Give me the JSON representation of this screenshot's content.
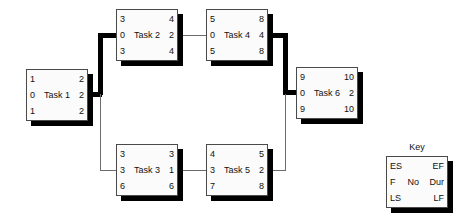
{
  "diagram": {
    "node_field_order": [
      "ES",
      "EF",
      "F",
      "No",
      "Dur",
      "LS",
      "LF"
    ]
  },
  "nodes": [
    {
      "id": "task-1",
      "name": "Task 1",
      "es": "1",
      "ef": "2",
      "f": "0",
      "dur": "2",
      "ls": "1",
      "lf": "2",
      "critical": true
    },
    {
      "id": "task-2",
      "name": "Task 2",
      "es": "3",
      "ef": "4",
      "f": "0",
      "dur": "2",
      "ls": "3",
      "lf": "4",
      "critical": true
    },
    {
      "id": "task-3",
      "name": "Task 3",
      "es": "3",
      "ef": "3",
      "f": "3",
      "dur": "1",
      "ls": "6",
      "lf": "6",
      "critical": false
    },
    {
      "id": "task-4",
      "name": "Task 4",
      "es": "5",
      "ef": "8",
      "f": "0",
      "dur": "4",
      "ls": "5",
      "lf": "8",
      "critical": true
    },
    {
      "id": "task-5",
      "name": "Task 5",
      "es": "4",
      "ef": "5",
      "f": "3",
      "dur": "2",
      "ls": "7",
      "lf": "8",
      "critical": false
    },
    {
      "id": "task-6",
      "name": "Task 6",
      "es": "9",
      "ef": "10",
      "f": "0",
      "dur": "2",
      "ls": "9",
      "lf": "10",
      "critical": true
    }
  ],
  "key": {
    "title": "Key",
    "es": "ES",
    "ef": "EF",
    "f": "F",
    "no": "No",
    "dur": "Dur",
    "ls": "LS",
    "lf": "LF"
  },
  "colors": {
    "box_fill": "#fbfbfb",
    "box_border": "#4a4a4a",
    "shadow": "#000000",
    "critical_path": "#000000",
    "normal_path": "#6b6b6b",
    "text": "#111111"
  }
}
